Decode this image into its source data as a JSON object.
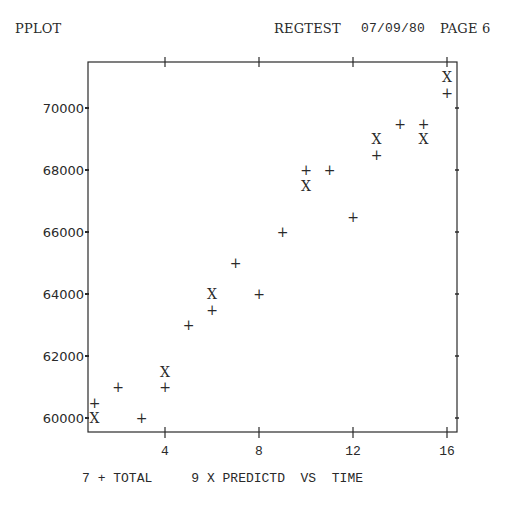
{
  "header": {
    "program": "PPLOT",
    "job": "REGTEST",
    "date": "07/09/80",
    "page": "PAGE 6"
  },
  "legend": {
    "items": [
      {
        "count": "7",
        "symbol": "+",
        "name": "TOTAL"
      },
      {
        "count": "9",
        "symbol": "X",
        "name": "PREDICTD"
      }
    ],
    "vs_label": "VS",
    "x_variable": "TIME"
  },
  "colors": {
    "ink": "#2a2a2a",
    "background": "#ffffff"
  },
  "chart_data": {
    "type": "scatter",
    "xlabel": "TIME",
    "ylabel": "",
    "xlim": [
      0.75,
      16.5
    ],
    "ylim": [
      59600,
      71600
    ],
    "x_ticks": [
      4,
      8,
      12,
      16
    ],
    "y_ticks": [
      60000,
      62000,
      64000,
      66000,
      68000,
      70000
    ],
    "grid": false,
    "legend_position": "bottom",
    "series": [
      {
        "name": "TOTAL",
        "symbol": "+",
        "points": [
          [
            1,
            60500
          ],
          [
            2,
            61000
          ],
          [
            3,
            60000
          ],
          [
            4,
            61000
          ],
          [
            5,
            63000
          ],
          [
            6,
            63500
          ],
          [
            7,
            65000
          ],
          [
            8,
            64000
          ],
          [
            9,
            66000
          ],
          [
            10,
            68000
          ],
          [
            11,
            68000
          ],
          [
            12,
            66500
          ],
          [
            13,
            68500
          ],
          [
            14,
            69500
          ],
          [
            15,
            69500
          ],
          [
            16,
            70500
          ]
        ]
      },
      {
        "name": "PREDICTD",
        "symbol": "X",
        "points": [
          [
            1,
            60000
          ],
          [
            4,
            61500
          ],
          [
            6,
            64000
          ],
          [
            10,
            67500
          ],
          [
            13,
            69000
          ],
          [
            15,
            69000
          ],
          [
            16,
            71000
          ]
        ]
      }
    ]
  }
}
